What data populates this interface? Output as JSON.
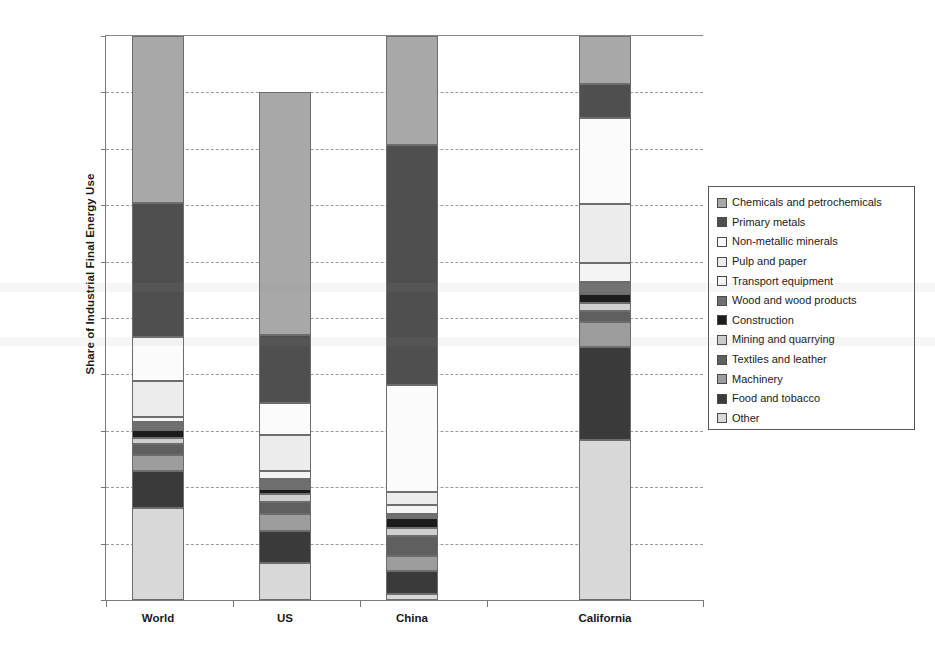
{
  "chart_data": {
    "type": "bar",
    "subtype": "stacked-percent",
    "title": "",
    "xlabel": "",
    "ylabel": "Share of Industrial Final Energy Use",
    "ylim": [
      0,
      100
    ],
    "ytick_labels": [
      "0%",
      "10%",
      "20%",
      "30%",
      "40%",
      "50%",
      "60%",
      "70%",
      "80%",
      "90%",
      "100%"
    ],
    "ytick_values": [
      0,
      10,
      20,
      30,
      40,
      50,
      60,
      70,
      80,
      90,
      100
    ],
    "grid": "horizontal-dashed",
    "legend_position": "right",
    "categories": [
      "World",
      "US",
      "China",
      "California"
    ],
    "series": [
      {
        "name": "Chemicals and petrochemicals",
        "color": "#a8a8a8",
        "values": [
          29.6,
          43.0,
          19.3,
          8.5
        ]
      },
      {
        "name": "Primary metals",
        "color": "#4f4f4f",
        "values": [
          23.7,
          12.0,
          42.5,
          6.0
        ]
      },
      {
        "name": "Non-metallic minerals",
        "color": "#fbfbfb",
        "values": [
          7.9,
          5.8,
          19.0,
          15.3
        ]
      },
      {
        "name": "Pulp and paper",
        "color": "#ececec",
        "values": [
          6.4,
          6.3,
          2.4,
          10.5
        ]
      },
      {
        "name": "Transport equipment",
        "color": "#f4f4f4",
        "values": [
          0.9,
          1.4,
          1.6,
          3.4
        ]
      },
      {
        "name": "Wood and wood products",
        "color": "#6f6f6f",
        "values": [
          1.3,
          1.8,
          0.6,
          2.1
        ]
      },
      {
        "name": "Construction",
        "color": "#1c1c1c",
        "values": [
          1.5,
          0.9,
          1.9,
          1.5
        ]
      },
      {
        "name": "Mining and quarrying",
        "color": "#cfcfcf",
        "values": [
          1.0,
          1.5,
          1.3,
          1.4
        ]
      },
      {
        "name": "Textiles and leather",
        "color": "#5f5f5f",
        "values": [
          2.0,
          2.0,
          3.6,
          2.0
        ]
      },
      {
        "name": "Machinery",
        "color": "#9d9d9d",
        "values": [
          2.8,
          3.1,
          2.7,
          4.5
        ]
      },
      {
        "name": "Food and tobacco",
        "color": "#3a3a3a",
        "values": [
          6.5,
          5.6,
          4.1,
          16.5
        ]
      },
      {
        "name": "Other",
        "color": "#d8d8d8",
        "values": [
          16.4,
          6.6,
          1.0,
          28.3
        ]
      }
    ]
  },
  "legend": {
    "items": [
      {
        "label": "Chemicals and petrochemicals"
      },
      {
        "label": "Primary metals"
      },
      {
        "label": "Non-metallic minerals"
      },
      {
        "label": "Pulp and paper"
      },
      {
        "label": "Transport equipment"
      },
      {
        "label": "Wood and wood products"
      },
      {
        "label": "Construction"
      },
      {
        "label": "Mining and quarrying"
      },
      {
        "label": "Textiles and leather"
      },
      {
        "label": "Machinery"
      },
      {
        "label": "Food and tobacco"
      },
      {
        "label": "Other"
      }
    ]
  }
}
